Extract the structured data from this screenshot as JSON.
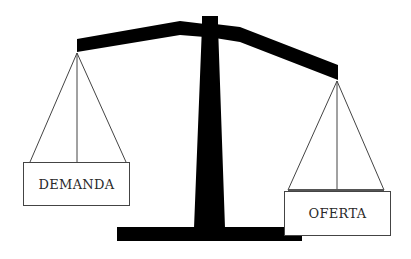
{
  "diagram": {
    "type": "balance-scale",
    "left_pan": {
      "label": "DEMANDA",
      "position": "raised"
    },
    "right_pan": {
      "label": "OFERTA",
      "position": "lowered"
    },
    "colors": {
      "beam": "#000000",
      "strings": "#444444",
      "box_border": "#444444",
      "text": "#2a2a2a",
      "background": "#ffffff"
    }
  }
}
